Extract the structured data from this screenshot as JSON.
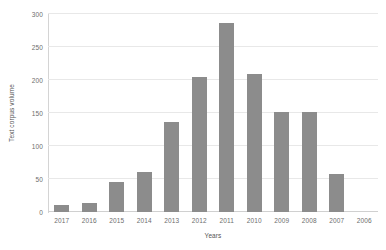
{
  "chart_data": {
    "type": "bar",
    "title": "",
    "xlabel": "Years",
    "ylabel": "Text corpus volume",
    "categories": [
      "2017",
      "2016",
      "2015",
      "2014",
      "2013",
      "2012",
      "2011",
      "2010",
      "2009",
      "2008",
      "2007",
      "2006"
    ],
    "values": [
      11,
      14,
      46,
      61,
      136,
      204,
      287,
      209,
      152,
      152,
      58,
      0
    ],
    "ylim": [
      0,
      300
    ],
    "yticks": [
      0,
      50,
      100,
      150,
      200,
      250,
      300
    ],
    "ytick_labels": [
      "0",
      "50",
      "100",
      "150",
      "200",
      "250",
      "300"
    ],
    "grid": true,
    "grid_axis": "y",
    "legend": false,
    "bar_color": "#8c8c8c",
    "gridline_color": "#e8e8e8",
    "axis_color": "#d4d4d4",
    "tick_label_color": "#6d6d6d",
    "axis_title_color": "#545454",
    "background": "#ffffff"
  }
}
